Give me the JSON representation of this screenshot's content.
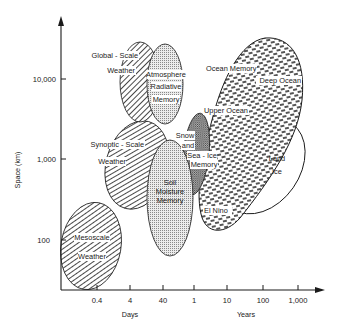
{
  "diagram": {
    "title": "",
    "y_axis": {
      "label": "Space (km)",
      "ticks": [
        {
          "label": "10,000",
          "y": 79
        },
        {
          "label": "1,000",
          "y": 159
        },
        {
          "label": "100",
          "y": 240
        }
      ]
    },
    "x_axis": {
      "ticks": [
        {
          "label": "0.4",
          "x": 97
        },
        {
          "label": "4",
          "x": 130
        },
        {
          "label": "40",
          "x": 163
        },
        {
          "label": "1",
          "x": 194
        },
        {
          "label": "10",
          "x": 227
        },
        {
          "label": "100",
          "x": 263
        },
        {
          "label": "1,000",
          "x": 298
        }
      ],
      "unit_labels": [
        {
          "label": "Days",
          "x": 130
        },
        {
          "label": "Years",
          "x": 246
        }
      ]
    },
    "regions": {
      "mesoscale": {
        "line1": "Mesoscale",
        "line2": "Weather"
      },
      "synoptic": {
        "line1": "Synoptic - Scale",
        "line2": "Weather"
      },
      "global": {
        "line1": "Global - Scale",
        "line2": "Weather"
      },
      "atmosphere": {
        "line1": "Atmosphere",
        "line2": "Radiative",
        "line3": "Memory"
      },
      "soil": {
        "line1": "Soil",
        "line2": "Moisture",
        "line3": "Memory"
      },
      "snow": {
        "line1": "Snow",
        "line2": "and",
        "line3": "Sea - Ice",
        "line4": "Memory"
      },
      "ocean": {
        "title": "Ocean Memory",
        "deep": "Deep Ocean",
        "upper": "Upper Ocean",
        "elnino": "El Nino"
      },
      "landice": {
        "line1": "Land",
        "line2": "Ice"
      }
    },
    "colors": {
      "ink": "#1a1a1a",
      "background": "#ffffff"
    }
  }
}
